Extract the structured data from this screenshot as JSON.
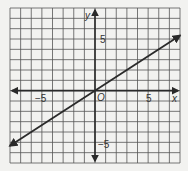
{
  "chart_data": {
    "type": "line",
    "title": "",
    "xlabel": "x",
    "ylabel": "y",
    "origin_label": "O",
    "xlim": [
      -8,
      8
    ],
    "ylim": [
      -7,
      8
    ],
    "grid": true,
    "tick_labels": {
      "x": [
        {
          "value": -5,
          "label": "−5"
        },
        {
          "value": 5,
          "label": "5"
        }
      ],
      "y": [
        {
          "value": 5,
          "label": "5"
        },
        {
          "value": -5,
          "label": "−5"
        }
      ]
    },
    "series": [
      {
        "name": "line",
        "equation": "y = (2/3)x",
        "x": [
          -8,
          0,
          8
        ],
        "y": [
          -5.33,
          0,
          5.33
        ],
        "arrows_both_ends": true
      }
    ]
  },
  "colors": {
    "background": "#f2f2f0",
    "grid": "#555555",
    "axis": "#2a2a2a",
    "line": "#2a2a2a"
  }
}
